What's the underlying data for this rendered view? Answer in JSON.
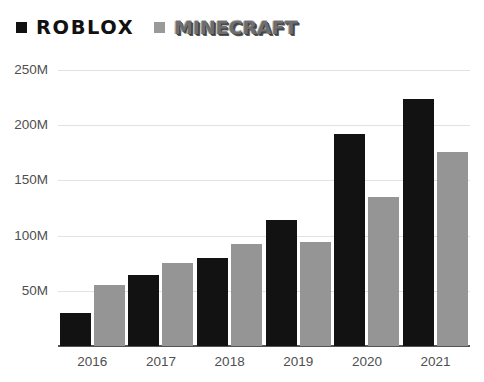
{
  "legend": {
    "entries": [
      {
        "name": "ROBLOX",
        "label": "ROBLOX",
        "color": "#121212",
        "swatch": "roblox"
      },
      {
        "name": "MINECRAFT",
        "label": "MINECRAFT",
        "color": "#959595",
        "swatch": "minecraft"
      }
    ]
  },
  "axis": {
    "y_ticks": [
      "50M",
      "100M",
      "150M",
      "200M",
      "250M"
    ],
    "y_tick_values": [
      50,
      100,
      150,
      200,
      250
    ],
    "x_ticks": [
      "2016",
      "2017",
      "2018",
      "2019",
      "2020",
      "2021"
    ]
  },
  "chart_data": {
    "type": "bar",
    "title": "",
    "xlabel": "",
    "ylabel": "",
    "categories": [
      "2016",
      "2017",
      "2018",
      "2019",
      "2020",
      "2021"
    ],
    "series": [
      {
        "name": "ROBLOX",
        "color": "#121212",
        "values": [
          30,
          64,
          80,
          114,
          192,
          224
        ]
      },
      {
        "name": "MINECRAFT",
        "color": "#959595",
        "values": [
          55,
          75,
          92,
          94,
          135,
          176
        ]
      }
    ],
    "value_unit": "M",
    "ylim": [
      0,
      250
    ],
    "ytick_step": 50,
    "grid": true,
    "legend_position": "top-left"
  }
}
